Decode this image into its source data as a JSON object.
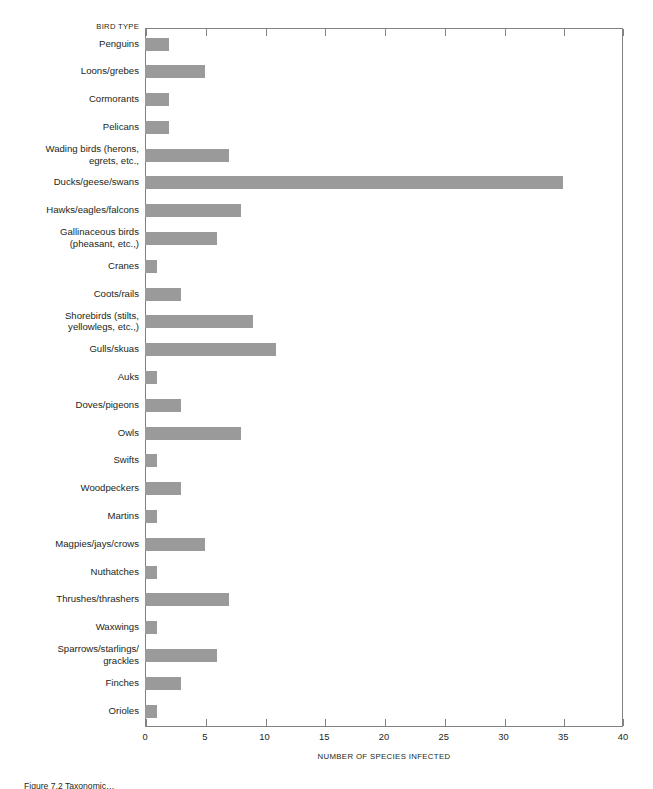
{
  "chart_data": {
    "type": "bar",
    "orientation": "horizontal",
    "title": "",
    "xlabel": "NUMBER OF SPECIES INFECTED",
    "ylabel": "BIRD TYPE",
    "xlim": [
      0,
      40
    ],
    "xticks": [
      0,
      5,
      10,
      15,
      20,
      25,
      30,
      35,
      40
    ],
    "grid": false,
    "legend": null,
    "bar_color": "#9a9a9a",
    "frame_color": "#808285",
    "categories": [
      "Penguins",
      "Loons/grebes",
      "Cormorants",
      "Pelicans",
      "Wading birds (herons,\negrets, etc.,",
      "Ducks/geese/swans",
      "Hawks/eagles/falcons",
      "Gallinaceous birds\n(pheasant, etc.,)",
      "Cranes",
      "Coots/rails",
      "Shorebirds (stilts,\nyellowlegs, etc.,)",
      "Gulls/skuas",
      "Auks",
      "Doves/pigeons",
      "Owls",
      "Swifts",
      "Woodpeckers",
      "Martins",
      "Magpies/jays/crows",
      "Nuthatches",
      "Thrushes/thrashers",
      "Waxwings",
      "Sparrows/starlings/\ngrackles",
      "Finches",
      "Orioles"
    ],
    "values": [
      2,
      5,
      2,
      2,
      7,
      35,
      8,
      6,
      1,
      3,
      9,
      11,
      1,
      3,
      8,
      1,
      3,
      1,
      5,
      1,
      7,
      1,
      6,
      3,
      1
    ]
  },
  "caption": {
    "text": "Figure 7.2   Taxonomic…"
  }
}
